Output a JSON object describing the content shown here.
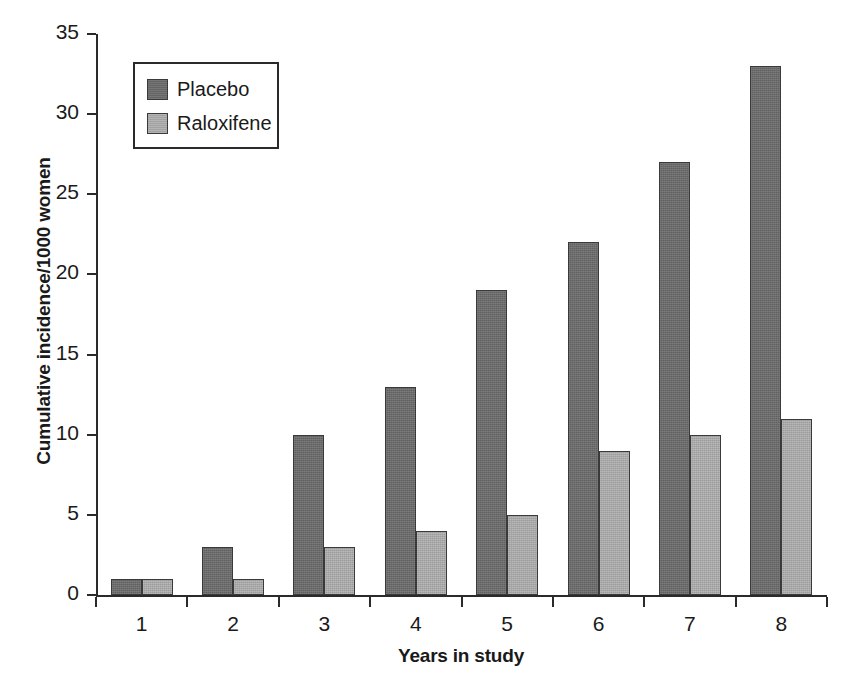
{
  "chart_data": {
    "type": "bar",
    "title": "",
    "subtitle": "",
    "xlabel": "Years in study",
    "ylabel": "Cumulative incidence/1000 women",
    "categories": [
      "1",
      "2",
      "3",
      "4",
      "5",
      "6",
      "7",
      "8"
    ],
    "series": [
      {
        "name": "Placebo",
        "color": "#6a6a6a",
        "values": [
          1,
          3,
          10,
          13,
          19,
          22,
          27,
          33
        ]
      },
      {
        "name": "Raloxifene",
        "color": "#ababab",
        "values": [
          1,
          1,
          3,
          4,
          5,
          9,
          10,
          11
        ]
      }
    ],
    "ylim": [
      0,
      35
    ],
    "yticks": [
      0,
      5,
      10,
      15,
      20,
      25,
      30,
      35
    ],
    "ytick_labels": [
      "0",
      "5",
      "10",
      "15",
      "20",
      "25",
      "30",
      "35"
    ],
    "grid": false,
    "legend_position": "top-left-inside",
    "legend_entries": [
      "Placebo",
      "Raloxifene"
    ]
  },
  "axes": {
    "y_title": "Cumulative incidence/1000 women",
    "x_title": "Years in study"
  },
  "legend": {
    "items": [
      {
        "label": "Placebo",
        "swatch": "placebo-swatch-icon"
      },
      {
        "label": "Raloxifene",
        "swatch": "raloxifene-swatch-icon"
      }
    ]
  }
}
